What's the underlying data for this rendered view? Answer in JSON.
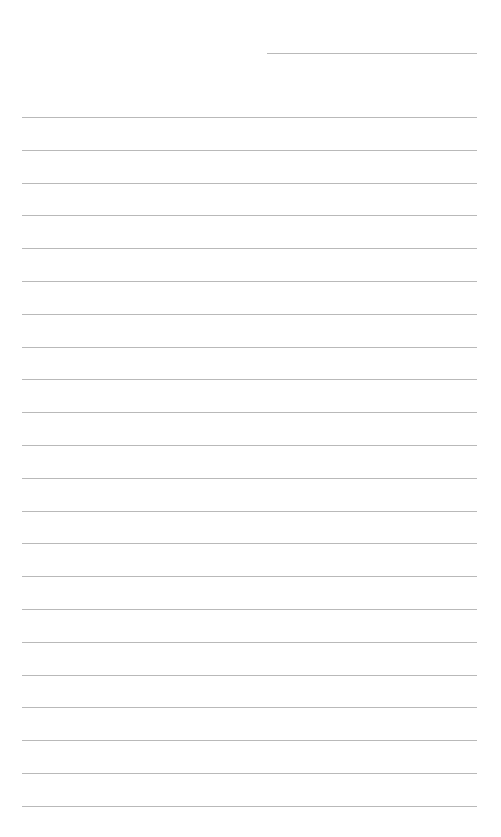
{
  "document": {
    "type": "lined-paper",
    "background_color": "#ffffff",
    "rule_color": "#b9b9b9",
    "header_line": {
      "present": true,
      "label": ""
    },
    "line_count": 22,
    "line_spacing_px": 32.8,
    "lines": [
      "",
      "",
      "",
      "",
      "",
      "",
      "",
      "",
      "",
      "",
      "",
      "",
      "",
      "",
      "",
      "",
      "",
      "",
      "",
      "",
      "",
      ""
    ]
  }
}
